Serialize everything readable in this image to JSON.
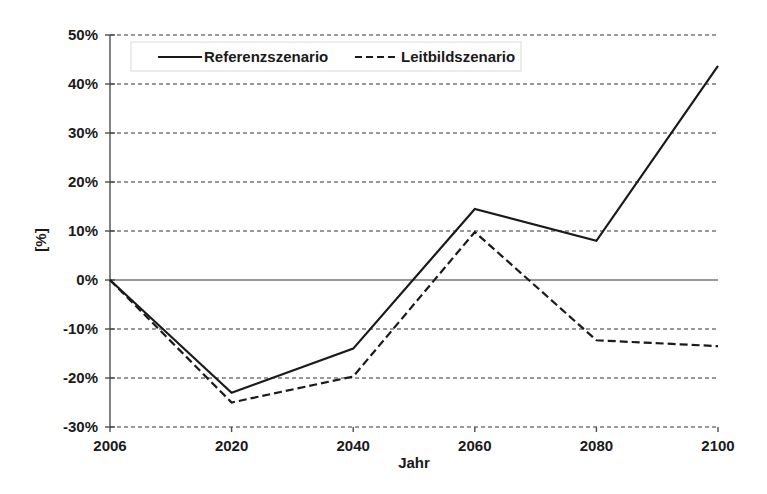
{
  "chart_data": {
    "type": "line",
    "title": "",
    "xlabel": "Jahr",
    "ylabel": "[%]",
    "x": [
      2006,
      2020,
      2040,
      2060,
      2080,
      2100
    ],
    "categories": [
      "2006",
      "2020",
      "2040",
      "2060",
      "2080",
      "2100"
    ],
    "series": [
      {
        "name": "Referenzszenario",
        "style": "solid",
        "color": "#1a1a1a",
        "values": [
          0,
          -23,
          -14,
          14.5,
          8,
          43.7
        ]
      },
      {
        "name": "Leitbildszenario",
        "style": "dashed",
        "color": "#1a1a1a",
        "values": [
          0,
          -25,
          -19.7,
          9.8,
          -12.3,
          -13.5
        ]
      }
    ],
    "ylim": [
      -30,
      50
    ],
    "ytick_values": [
      50,
      40,
      30,
      20,
      10,
      0,
      -10,
      -20,
      -30
    ],
    "ytick_labels": [
      "50%",
      "40%",
      "30%",
      "20%",
      "10%",
      "0%",
      "-10%",
      "-20%",
      "-30%"
    ],
    "xtick_labels": [
      "2006",
      "2020",
      "2040",
      "2060",
      "2080",
      "2100"
    ],
    "grid": "horizontal-dashed",
    "legend_position": "top-inside-left"
  },
  "legend": {
    "entries": [
      {
        "label": "Referenzszenario",
        "style": "solid"
      },
      {
        "label": "Leitbildszenario",
        "style": "dashed"
      }
    ]
  },
  "axes": {
    "y_title": "[%]",
    "x_title": "Jahr"
  }
}
